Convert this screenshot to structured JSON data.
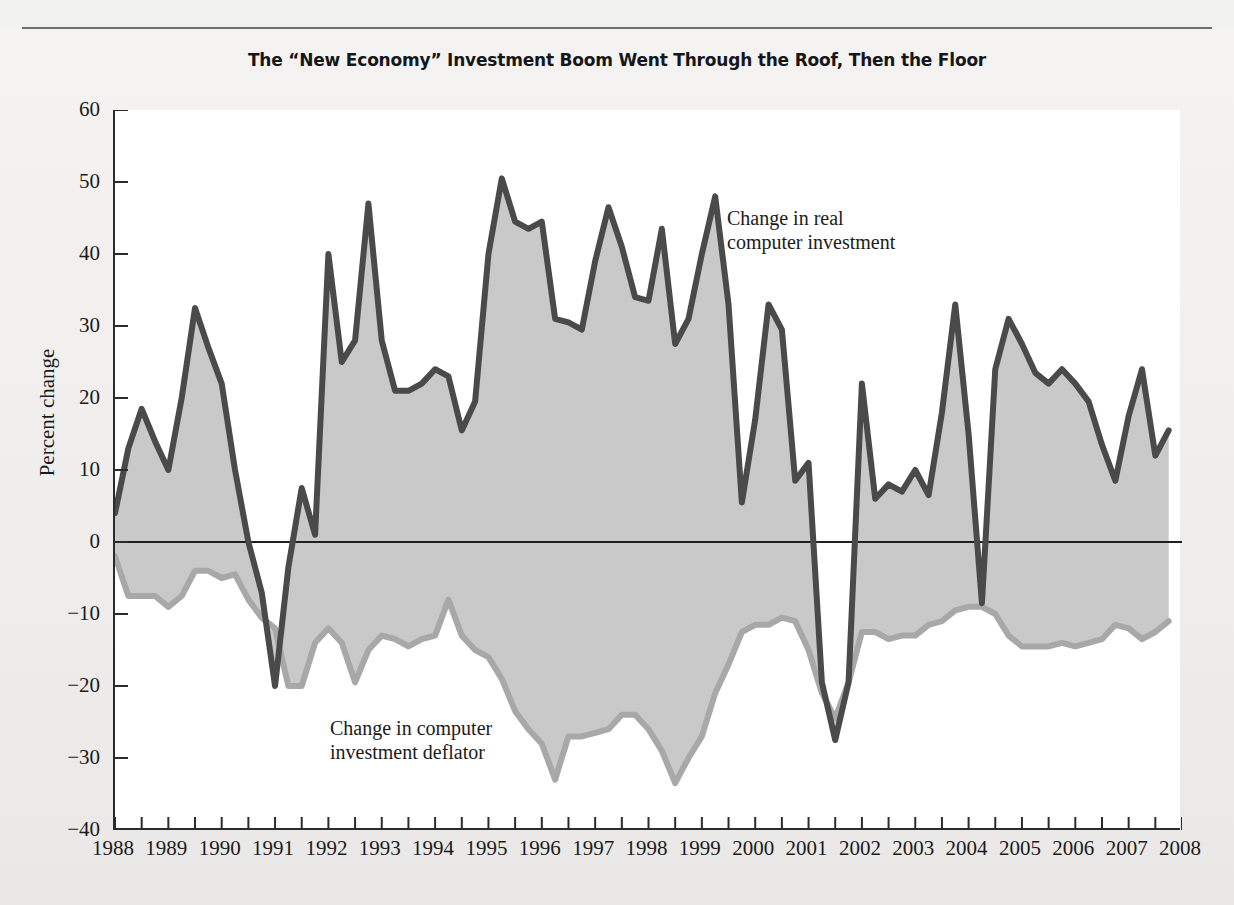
{
  "title": "The “New Economy” Investment Boom Went Through the Roof, Then the Floor",
  "axes": {
    "y_title": "Percent change",
    "y_ticks": [
      "60",
      "50",
      "40",
      "30",
      "20",
      "10",
      "0",
      "−10",
      "−20",
      "−30",
      "−40"
    ],
    "x_ticks": [
      "1988",
      "1989",
      "1990",
      "1991",
      "1992",
      "1993",
      "1994",
      "1995",
      "1996",
      "1997",
      "1998",
      "1999",
      "2000",
      "2001",
      "2002",
      "2003",
      "2004",
      "2005",
      "2006",
      "2007",
      "2008"
    ]
  },
  "annotations": {
    "investment": "Change in real\ncomputer investment",
    "deflator": "Change in computer\ninvestment deflator"
  },
  "colors": {
    "investment_line": "#4a4a4a",
    "deflator_line": "#a8a8a8",
    "band_fill": "#c9c9c9",
    "axis": "#2b2b2b",
    "zero_line": "#1f1f1f",
    "plot_background": "#ffffff",
    "page_background": "#efeeec",
    "text": "#1b1b1b"
  },
  "chart_data": {
    "type": "area",
    "title": "The “New Economy” Investment Boom Went Through the Roof, Then the Floor",
    "xlabel": "",
    "ylabel": "Percent change",
    "ylim": [
      -40,
      60
    ],
    "xlim": [
      1988,
      2008
    ],
    "grid": false,
    "legend": "annotated-inline",
    "frequency": "quarterly",
    "x": [
      1988.0,
      1988.25,
      1988.5,
      1988.75,
      1989.0,
      1989.25,
      1989.5,
      1989.75,
      1990.0,
      1990.25,
      1990.5,
      1990.75,
      1991.0,
      1991.25,
      1991.5,
      1991.75,
      1992.0,
      1992.25,
      1992.5,
      1992.75,
      1993.0,
      1993.25,
      1993.5,
      1993.75,
      1994.0,
      1994.25,
      1994.5,
      1994.75,
      1995.0,
      1995.25,
      1995.5,
      1995.75,
      1996.0,
      1996.25,
      1996.5,
      1996.75,
      1997.0,
      1997.25,
      1997.5,
      1997.75,
      1998.0,
      1998.25,
      1998.5,
      1998.75,
      1999.0,
      1999.25,
      1999.5,
      1999.75,
      2000.0,
      2000.25,
      2000.5,
      2000.75,
      2001.0,
      2001.25,
      2001.5,
      2001.75,
      2002.0,
      2002.25,
      2002.5,
      2002.75,
      2003.0,
      2003.25,
      2003.5,
      2003.75,
      2004.0,
      2004.25,
      2004.5,
      2004.75,
      2005.0,
      2005.25,
      2005.5,
      2005.75,
      2006.0,
      2006.25,
      2006.5,
      2006.75,
      2007.0,
      2007.25,
      2007.5,
      2007.75
    ],
    "series": [
      {
        "name": "Change in real computer investment",
        "color": "#4a4a4a",
        "values": [
          4,
          13,
          18.5,
          14,
          10,
          20,
          32.5,
          27,
          22,
          10,
          0,
          -7,
          -20,
          -3.5,
          7.5,
          1,
          40,
          25,
          28,
          47,
          28,
          21,
          21,
          22,
          24,
          23,
          15.5,
          19.5,
          40,
          50.5,
          44.5,
          43.5,
          44.5,
          31,
          30.5,
          29.5,
          39,
          46.5,
          41,
          34,
          33.5,
          43.5,
          27.5,
          31,
          40,
          48,
          33,
          5.5,
          17,
          33,
          29.5,
          8.5,
          11,
          -19.5,
          -27.5,
          -19.5,
          22,
          6,
          8,
          7,
          10,
          6.5,
          18,
          33,
          15,
          -8.5,
          24,
          31,
          27.5,
          23.5,
          22,
          24,
          22,
          19.5,
          13.5,
          8.5,
          17.5,
          24,
          12,
          15.5
        ]
      },
      {
        "name": "Change in computer investment deflator",
        "color": "#a8a8a8",
        "values": [
          -2,
          -7.5,
          -7.5,
          -7.5,
          -9,
          -7.5,
          -4,
          -4,
          -5,
          -4.5,
          -8,
          -10.5,
          -12,
          -20,
          -20,
          -14,
          -12,
          -14,
          -19.5,
          -15,
          -13,
          -13.5,
          -14.5,
          -13.5,
          -13,
          -8,
          -13,
          -15,
          -16,
          -19,
          -23.5,
          -26,
          -28,
          -33,
          -27,
          -27,
          -26.5,
          -26,
          -24,
          -24,
          -26,
          -29,
          -33.5,
          -30,
          -27,
          -21,
          -17,
          -12.5,
          -11.5,
          -11.5,
          -10.5,
          -11,
          -15,
          -21,
          -24.5,
          -19.5,
          -12.5,
          -12.5,
          -13.5,
          -13,
          -13,
          -11.5,
          -11,
          -9.5,
          -9,
          -9,
          -10,
          -13,
          -14.5,
          -14.5,
          -14.5,
          -14,
          -14.5,
          -14,
          -13.5,
          -11.5,
          -12,
          -13.5,
          -12.5,
          -11
        ]
      }
    ]
  }
}
